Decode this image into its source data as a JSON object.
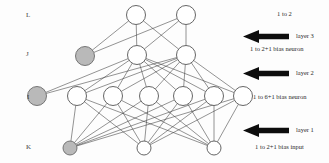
{
  "diagram": {
    "background_color": "#fdfdfd",
    "edge_color": "#3a3a3a",
    "node_fill": "#ffffff",
    "node_stroke": "#555555",
    "bias_node_fill": "#b9b9b9",
    "bias_node_stroke": "#6a6a6a",
    "arrow_color": "#0d0d0d"
  },
  "layer_letters": [
    {
      "id": "letter-L",
      "label": "L",
      "x": 26,
      "y": 11
    },
    {
      "id": "letter-J",
      "label": "J",
      "x": 26,
      "y": 50
    },
    {
      "id": "letter-I",
      "label": "I",
      "x": 27,
      "y": 93
    },
    {
      "id": "letter-K",
      "label": "K",
      "x": 26,
      "y": 143
    }
  ],
  "layers": [
    {
      "name": "L",
      "role": "output-layer",
      "y": 15,
      "nodes": [
        {
          "id": "L1",
          "cx": 136,
          "cy": 15,
          "r": 9.5,
          "type": "neuron"
        },
        {
          "id": "L2",
          "cx": 186,
          "cy": 15,
          "r": 9.5,
          "type": "neuron"
        }
      ]
    },
    {
      "name": "J",
      "role": "hidden-layer-2",
      "y": 55,
      "nodes": [
        {
          "id": "Jb",
          "cx": 85,
          "cy": 56,
          "r": 9.5,
          "type": "bias"
        },
        {
          "id": "J1",
          "cx": 137,
          "cy": 55,
          "r": 9.5,
          "type": "neuron"
        },
        {
          "id": "J2",
          "cx": 186,
          "cy": 55,
          "r": 9.5,
          "type": "neuron"
        }
      ]
    },
    {
      "name": "I",
      "role": "hidden-layer-1",
      "y": 96,
      "nodes": [
        {
          "id": "Ib",
          "cx": 37,
          "cy": 96,
          "r": 9.5,
          "type": "bias"
        },
        {
          "id": "I1",
          "cx": 77,
          "cy": 96,
          "r": 9.5,
          "type": "neuron"
        },
        {
          "id": "I2",
          "cx": 113,
          "cy": 96,
          "r": 9.5,
          "type": "neuron"
        },
        {
          "id": "I3",
          "cx": 149,
          "cy": 96,
          "r": 9.5,
          "type": "neuron"
        },
        {
          "id": "I4",
          "cx": 183,
          "cy": 96,
          "r": 9.5,
          "type": "neuron"
        },
        {
          "id": "I5",
          "cx": 214,
          "cy": 96,
          "r": 9.5,
          "type": "neuron"
        },
        {
          "id": "I6",
          "cx": 243,
          "cy": 96,
          "r": 9.5,
          "type": "neuron"
        }
      ]
    },
    {
      "name": "K",
      "role": "input-layer",
      "y": 148,
      "nodes": [
        {
          "id": "Kb",
          "cx": 70,
          "cy": 148,
          "r": 7,
          "type": "bias"
        },
        {
          "id": "K1",
          "cx": 144,
          "cy": 148,
          "r": 7,
          "type": "neuron"
        },
        {
          "id": "K2",
          "cx": 214,
          "cy": 148,
          "r": 7,
          "type": "neuron"
        }
      ]
    }
  ],
  "connections": {
    "K_to_I": "full",
    "I_to_J": "full",
    "J_to_L": "full",
    "bias_I_to_J": "full",
    "bias_J_to_L": "full"
  },
  "annotations": {
    "top_range": {
      "label": "1 to 2",
      "x": 277,
      "y": 10
    },
    "layer3": {
      "arrow_label": "layer 3",
      "range_label": "1 to 2+1   bias neuron",
      "arrow_x": 243,
      "arrow_y": 30,
      "label_x": 296,
      "label_y": 32,
      "range_x": 250,
      "range_y": 45
    },
    "layer2": {
      "arrow_label": "layer 2",
      "range_label": "1 to 6+1    bias neuron",
      "arrow_x": 243,
      "arrow_y": 67,
      "label_x": 296,
      "label_y": 69,
      "range_x": 253,
      "range_y": 93
    },
    "layer1": {
      "arrow_label": "layer 1",
      "range_label": "1 to 2+1 bias input",
      "arrow_x": 243,
      "arrow_y": 124,
      "label_x": 296,
      "label_y": 126,
      "range_x": 255,
      "range_y": 143
    }
  }
}
